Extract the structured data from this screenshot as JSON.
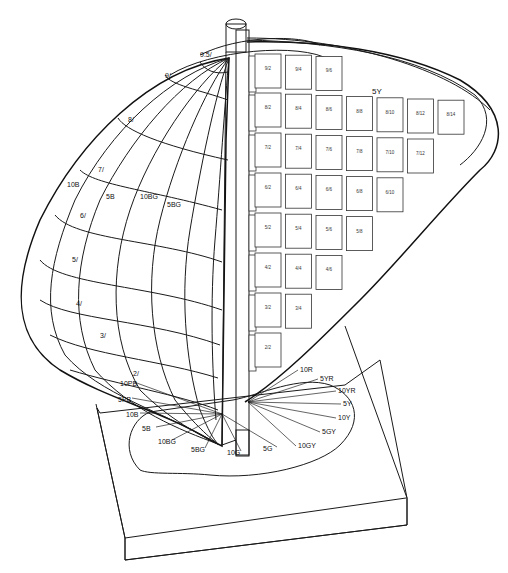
{
  "diagram": {
    "page_hue_label": "5Y",
    "value_labels_left": [
      "9.5/",
      "9/",
      "8/",
      "7/",
      "6/",
      "5/",
      "4/",
      "3/",
      "2/"
    ],
    "hue_meridian_labels": [
      "10B",
      "5B",
      "10BG",
      "5BG"
    ],
    "chip_rows": [
      {
        "value": 9,
        "chips": [
          "9/2",
          "9/4",
          "9/6"
        ]
      },
      {
        "value": 8,
        "chips": [
          "8/2",
          "8/4",
          "8/6",
          "8/8",
          "8/10",
          "8/12",
          "8/14"
        ]
      },
      {
        "value": 7,
        "chips": [
          "7/2",
          "7/4",
          "7/6",
          "7/8",
          "7/10",
          "7/12"
        ]
      },
      {
        "value": 6,
        "chips": [
          "6/2",
          "6/4",
          "6/6",
          "6/8",
          "6/10"
        ]
      },
      {
        "value": 5,
        "chips": [
          "5/2",
          "5/4",
          "5/6",
          "5/8"
        ]
      },
      {
        "value": 4,
        "chips": [
          "4/2",
          "4/4",
          "4/6"
        ]
      },
      {
        "value": 3,
        "chips": [
          "3/2",
          "3/4"
        ]
      },
      {
        "value": 2,
        "chips": [
          "2/2"
        ]
      }
    ],
    "base_hue_labels_right": [
      "10R",
      "5YR",
      "10YR",
      "5Y",
      "10Y",
      "5GY",
      "10GY"
    ],
    "base_hue_labels_left": [
      "10PB",
      "5PB",
      "10B",
      "5B",
      "10BG",
      "5BG",
      "10G",
      "5G"
    ]
  }
}
